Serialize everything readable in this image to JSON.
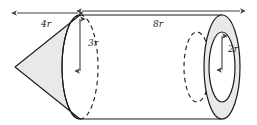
{
  "figure": {
    "background_color": "#ffffff",
    "stroke_color": "#1a1a1a",
    "fill_color": "#e6e6e6",
    "shapes": [
      {
        "name": "cone",
        "label": "left cone, apex pointing left"
      },
      {
        "name": "cylinder",
        "label": "right cylinder with hollow bore"
      },
      {
        "name": "annulus",
        "label": "right end tube opening"
      },
      {
        "name": "hidden-ellipse",
        "label": "dashed hidden circle"
      }
    ]
  },
  "labels": {
    "cone_length": "4r",
    "cylinder_length": "8r",
    "outer_radius": "3r",
    "inner_radius": "2r"
  },
  "dimensions": [
    {
      "name": "cone-length",
      "value": "4r",
      "orientation": "horizontal",
      "arrows": "double"
    },
    {
      "name": "cylinder-length",
      "value": "8r",
      "orientation": "horizontal",
      "arrows": "double"
    },
    {
      "name": "outer-radius",
      "value": "3r",
      "orientation": "vertical",
      "arrows": "double"
    },
    {
      "name": "inner-radius",
      "value": "2r",
      "orientation": "vertical",
      "arrows": "double"
    }
  ]
}
